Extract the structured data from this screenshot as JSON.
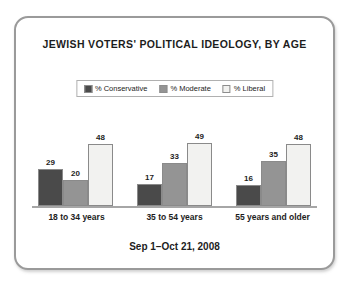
{
  "card": {
    "border_color": "#9a9a9a",
    "background": "#ffffff"
  },
  "title": "JEWISH VOTERS' POLITICAL IDEOLOGY, BY AGE",
  "footer": "Sep 1–Oct 21, 2008",
  "legend": {
    "position": "top-center",
    "items": [
      {
        "label": "% Conservative",
        "color": "#4a4a4a"
      },
      {
        "label": "% Moderate",
        "color": "#949494"
      },
      {
        "label": "% Liberal",
        "color": "#f2f2f0"
      }
    ]
  },
  "axis": {
    "baseline_color": "#a6a6a6",
    "gridlines": false
  },
  "chart_data": {
    "type": "bar",
    "title": "JEWISH VOTERS' POLITICAL IDEOLOGY, BY AGE",
    "subtitle": "Sep 1–Oct 21, 2008",
    "xlabel": "",
    "ylabel": "",
    "ylim": [
      0,
      55
    ],
    "grid": false,
    "legend_position": "top-center",
    "categories": [
      "18 to 34 years",
      "35 to 54 years",
      "55 years and older"
    ],
    "series": [
      {
        "name": "% Conservative",
        "color": "#4a4a4a",
        "values": [
          29,
          17,
          16
        ]
      },
      {
        "name": "% Moderate",
        "color": "#949494",
        "values": [
          20,
          33,
          35
        ]
      },
      {
        "name": "% Liberal",
        "color": "#f2f2f0",
        "values": [
          48,
          49,
          48
        ]
      }
    ]
  }
}
